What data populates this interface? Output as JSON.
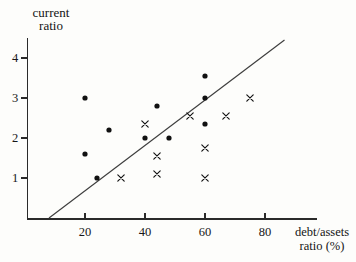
{
  "labels": {
    "y_axis_line1": "current",
    "y_axis_line2": "ratio",
    "x_axis_line1": "debt/assets",
    "x_axis_line2": "ratio (%)"
  },
  "colors": {
    "ink": "#1a1a1a",
    "marker": "#111111",
    "line": "#3d3d3d",
    "background": "#fdfdfb"
  },
  "chart_data": {
    "type": "scatter",
    "title": "",
    "xlabel": "debt/assets ratio (%)",
    "ylabel": "current ratio",
    "x_ticks": [
      20,
      40,
      60,
      80
    ],
    "y_ticks": [
      1,
      2,
      3,
      4
    ],
    "xlim": [
      0,
      95
    ],
    "ylim": [
      0,
      4.5
    ],
    "grid": false,
    "legend": "none",
    "series": [
      {
        "name": "dot-group",
        "marker": "filled-circle",
        "points": [
          [
            20,
            3.0
          ],
          [
            28,
            2.2
          ],
          [
            20,
            1.6
          ],
          [
            24,
            1.0
          ],
          [
            44,
            2.8
          ],
          [
            40,
            2.0
          ],
          [
            48,
            2.0
          ],
          [
            60,
            3.55
          ],
          [
            60,
            3.0
          ],
          [
            60,
            2.35
          ]
        ]
      },
      {
        "name": "cross-group",
        "marker": "x",
        "points": [
          [
            40,
            2.35
          ],
          [
            44,
            1.55
          ],
          [
            44,
            1.1
          ],
          [
            32,
            1.0
          ],
          [
            55,
            2.55
          ],
          [
            67,
            2.55
          ],
          [
            75,
            3.0
          ],
          [
            60,
            1.75
          ],
          [
            60,
            1.0
          ]
        ]
      }
    ],
    "fit_line": {
      "x1": 8,
      "y1": 0.0,
      "x2": 86.5,
      "y2": 4.45
    }
  }
}
